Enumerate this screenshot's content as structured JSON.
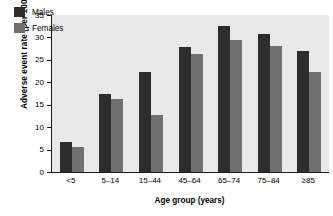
{
  "chart_data": {
    "type": "bar",
    "title": "",
    "xlabel": "Age group (years)",
    "ylabel": "Adverse event rate (per 1000)",
    "categories": [
      "<5",
      "5–14",
      "15–44",
      "45–64",
      "65–74",
      "75–84",
      "≥85"
    ],
    "series": [
      {
        "name": "Males",
        "color": "#2d2d2d",
        "values": [
          6.7,
          17.4,
          22.3,
          27.9,
          32.6,
          30.8,
          27.0
        ]
      },
      {
        "name": "Females",
        "color": "#707070",
        "values": [
          5.6,
          16.3,
          12.7,
          26.3,
          29.5,
          28.2,
          22.4
        ]
      }
    ],
    "ylim": [
      0,
      35
    ],
    "yticks": [
      0,
      5,
      10,
      15,
      20,
      25,
      30,
      35
    ],
    "ytick_labels": [
      "0",
      "5",
      "10",
      "15",
      "20",
      "25",
      "30",
      "35"
    ],
    "grid": false,
    "legend_position": "top-left",
    "plot_background": "#e9e9e9",
    "axis_color": "#1a1a1a"
  },
  "legend": {
    "items": [
      {
        "label": "Males"
      },
      {
        "label": "Females"
      }
    ]
  }
}
